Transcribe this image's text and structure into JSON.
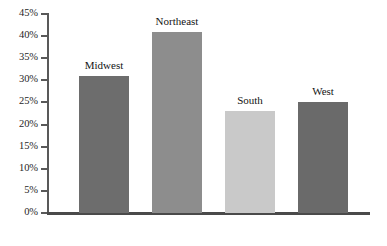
{
  "chart_data": {
    "type": "bar",
    "title": "",
    "subtitle": "",
    "xlabel": "",
    "ylabel": "",
    "categories": [
      "Midwest",
      "Northeast",
      "South",
      "West"
    ],
    "values": [
      31,
      41,
      23,
      25
    ],
    "value_labels": [
      "31%",
      "41%",
      "23%",
      "25%"
    ],
    "ylim": [
      0,
      45
    ],
    "ytick_values": [
      0,
      5,
      10,
      15,
      20,
      25,
      30,
      35,
      40,
      45
    ],
    "ytick_labels": [
      "0%",
      "5%",
      "10%",
      "15%",
      "20%",
      "25%",
      "30%",
      "35%",
      "40%",
      "45%"
    ],
    "grid": false,
    "legend": "none",
    "label_position": "above-bar",
    "bar_colors": [
      "#6d6d6d",
      "#8d8d8d",
      "#c9c9c9",
      "#6a6a6a"
    ],
    "axis_color": "#595959",
    "baseline_color": "#4a4a4a",
    "background": "#ffffff"
  },
  "bars": [
    {
      "label": "Midwest",
      "value": 31,
      "color": "#6d6d6d",
      "left": 79,
      "width": 50
    },
    {
      "label": "Northeast",
      "value": 41,
      "color": "#8d8d8d",
      "left": 152,
      "width": 50
    },
    {
      "label": "South",
      "value": 23,
      "color": "#c9c9c9",
      "left": 225,
      "width": 50
    },
    {
      "label": "West",
      "value": 25,
      "color": "#6a6a6a",
      "left": 298,
      "width": 50
    }
  ]
}
